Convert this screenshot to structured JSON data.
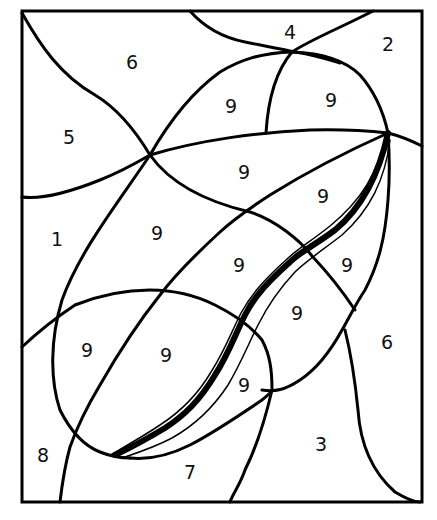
{
  "puzzle": {
    "type": "color-by-number",
    "colors": {
      "line": "#000000",
      "background": "#ffffff"
    },
    "labels": [
      {
        "id": "r1",
        "value": "6",
        "x": 132,
        "y": 62
      },
      {
        "id": "r2",
        "value": "4",
        "x": 290,
        "y": 32
      },
      {
        "id": "r3",
        "value": "2",
        "x": 388,
        "y": 44
      },
      {
        "id": "r4",
        "value": "9",
        "x": 231,
        "y": 106
      },
      {
        "id": "r5",
        "value": "9",
        "x": 331,
        "y": 100
      },
      {
        "id": "r6",
        "value": "5",
        "x": 69,
        "y": 137
      },
      {
        "id": "r7",
        "value": "9",
        "x": 244,
        "y": 172
      },
      {
        "id": "r8",
        "value": "9",
        "x": 323,
        "y": 196
      },
      {
        "id": "r9",
        "value": "1",
        "x": 57,
        "y": 239
      },
      {
        "id": "r10",
        "value": "9",
        "x": 157,
        "y": 233
      },
      {
        "id": "r11",
        "value": "9",
        "x": 239,
        "y": 265
      },
      {
        "id": "r12",
        "value": "9",
        "x": 347,
        "y": 265
      },
      {
        "id": "r13",
        "value": "9",
        "x": 297,
        "y": 313
      },
      {
        "id": "r14",
        "value": "6",
        "x": 387,
        "y": 342
      },
      {
        "id": "r15",
        "value": "9",
        "x": 87,
        "y": 350
      },
      {
        "id": "r16",
        "value": "9",
        "x": 166,
        "y": 355
      },
      {
        "id": "r17",
        "value": "9",
        "x": 244,
        "y": 385
      },
      {
        "id": "r18",
        "value": "8",
        "x": 43,
        "y": 455
      },
      {
        "id": "r19",
        "value": "3",
        "x": 321,
        "y": 444
      },
      {
        "id": "r20",
        "value": "7",
        "x": 190,
        "y": 472
      }
    ]
  }
}
